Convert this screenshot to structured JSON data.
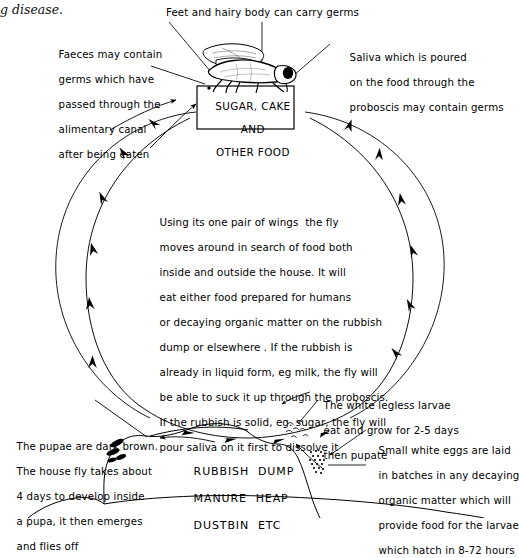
{
  "page": {
    "width": 502,
    "height": 518,
    "background": "#ffffff",
    "ink": "#000000"
  },
  "page_header": {
    "partial_caption": "g disease."
  },
  "food_box": {
    "line1": "SUGAR, CAKE",
    "line2": "AND",
    "line3": "OTHER FOOD"
  },
  "callouts": {
    "top_center": {
      "name": "feet-and-body-label",
      "text": "Feet and hairy body can carry germs"
    },
    "top_left": {
      "name": "faeces-label",
      "lines": [
        "Faeces may contain",
        "germs which have",
        "passed through the",
        "alimentary canal",
        "after being eaten"
      ]
    },
    "top_right": {
      "name": "saliva-label",
      "lines": [
        "Saliva which is poured",
        "on the food through the",
        "proboscis may contain germs"
      ]
    },
    "bottom_left": {
      "name": "pupae-label",
      "lines": [
        "The pupae are dark brown.",
        "The house fly takes about",
        "4 days to develop inside",
        "a pupa, it then emerges",
        "and flies off"
      ]
    },
    "bottom_right_upper": {
      "name": "larvae-label",
      "lines": [
        "The white legless larvae",
        "eat and grow for 2-5 days",
        "then pupate"
      ]
    },
    "bottom_right_lower": {
      "name": "eggs-label",
      "lines": [
        "Small white eggs are laid",
        "in batches in any decaying",
        "organic matter which will",
        "provide food for the larvae",
        "which hatch in 8-72 hours"
      ]
    }
  },
  "center_paragraph": {
    "name": "fly-behaviour-paragraph",
    "lines": [
      "Using its one pair of wings  the fly",
      "moves around in search of food both",
      "inside and outside the house. It will",
      "eat either food prepared for humans",
      "or decaying organic matter on the rubbish",
      "dump or elsewhere . If the rubbish is",
      "already in liquid form, eg milk, the fly will",
      "be able to suck it up through the proboscis.",
      "If the rubbish is solid, eg. sugar, the fly will",
      "pour saliva on it first to dissolve it"
    ]
  },
  "rubbish_dump": {
    "name": "rubbish-dump-label",
    "line1": "RUBBISH  DUMP",
    "line2": "MANURE  HEAP",
    "line3": "DUSTBIN  ETC"
  },
  "illustration_parts": {
    "fly": "housefly-illustration",
    "pupae": "pupae-cluster",
    "larvae": "larvae-cluster",
    "eggs": "egg-batch",
    "mound": "rubbish-mound",
    "cycle_inner": "life-cycle-inner-arrow-circle",
    "cycle_outer": "life-cycle-outer-circle"
  }
}
